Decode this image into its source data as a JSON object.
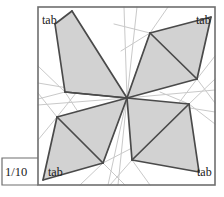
{
  "figure": {
    "type": "crease-pattern-diagram",
    "scale_label": "1/10",
    "corner_labels": {
      "top_left": "tab",
      "top_right": "tab",
      "bottom_left": "tab",
      "bottom_right": "tab"
    },
    "colors": {
      "panel_fill": "#d2d2d2",
      "panel_stroke": "#4a4a4a",
      "frame_stroke": "#6e6e6e",
      "crease_stroke": "#c9c9c9",
      "background": "#ffffff",
      "text": "#1a1a1a"
    },
    "frame": {
      "x": 38,
      "y": 7,
      "width": 177,
      "height": 178
    },
    "scale_box": {
      "x": 2,
      "y": 158,
      "width": 36,
      "height": 27
    },
    "center_point": {
      "x": 127,
      "y": 98
    },
    "shaded_panels": [
      {
        "name": "panel-top-left",
        "points": "72,11 127,98 65,92 55,24",
        "diagonal": "65,92 127,98"
      },
      {
        "name": "panel-top-right",
        "points": "127,98 150,33 211,17 197,79",
        "diagonal": "150,33 197,79"
      },
      {
        "name": "panel-bottom-left",
        "points": "127,98 103,163 43,180 57,117",
        "diagonal": "57,117 103,163"
      },
      {
        "name": "panel-bottom-right",
        "points": "127,98 189,104 199,172 132,160",
        "diagonal": "132,160 189,104"
      }
    ],
    "panel_edges": [
      "55,24 72,11",
      "72,11 127,98",
      "127,98 65,92",
      "65,92 55,24",
      "65,92 127,98",
      "127,98 150,33",
      "150,33 211,17",
      "211,17 197,79",
      "197,79 127,98",
      "150,33 197,79",
      "127,98 103,163",
      "103,163 43,180",
      "43,180 57,117",
      "57,117 127,98",
      "57,117 103,163",
      "127,98 189,104",
      "189,104 199,172",
      "199,172 132,160",
      "132,160 127,98",
      "132,160 189,104"
    ],
    "crease_lines": [
      "127,98 124,7",
      "127,98 137,7",
      "127,98 118,185",
      "127,98 108,185",
      "127,98 38,83",
      "127,98 38,105",
      "127,98 215,90",
      "127,98 215,112",
      "127,98 150,33",
      "127,98 103,163",
      "65,92 38,66",
      "65,92 96,62",
      "65,92 38,99",
      "65,92 86,124",
      "150,33 168,7",
      "150,33 114,24",
      "150,33 121,51",
      "197,79 215,56",
      "197,79 166,67",
      "197,79 215,103",
      "197,79 172,112",
      "57,117 38,93",
      "57,117 80,88",
      "57,117 38,140",
      "103,163 80,185",
      "103,163 125,185",
      "103,163 132,148",
      "189,104 215,79",
      "189,104 160,92",
      "189,104 215,124",
      "189,104 163,132",
      "132,160 110,185",
      "132,160 150,185"
    ]
  }
}
